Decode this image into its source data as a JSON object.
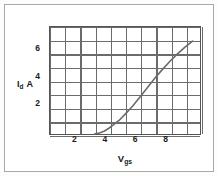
{
  "chart_data": {
    "type": "line",
    "title": "",
    "subtitle": "",
    "xlabel": "Vgs",
    "ylabel": "Id A",
    "xlabel_base": "V",
    "xlabel_sub": "gs",
    "ylabel_base": "I",
    "ylabel_sub": "d",
    "ylabel_unit": "A",
    "xlim": [
      0,
      10
    ],
    "ylim": [
      0,
      8
    ],
    "xticks": [
      2,
      4,
      6,
      8
    ],
    "yticks": [
      2,
      4,
      6
    ],
    "xtick_labels": [
      "2",
      "4",
      "6",
      "8"
    ],
    "ytick_labels": [
      "2",
      "4",
      "6"
    ],
    "x_gridlines": [
      0,
      1,
      2,
      3,
      4,
      5,
      6,
      7,
      8,
      9,
      10
    ],
    "y_gridlines": [
      0,
      1,
      2,
      3,
      4,
      5,
      6,
      7,
      8
    ],
    "grid": true,
    "legend": "none",
    "series": [
      {
        "name": "Id vs Vgs",
        "color": "#6b6b6b",
        "x": [
          3.0,
          3.3,
          3.6,
          3.9,
          4.2,
          4.6,
          5.0,
          5.5,
          6.0,
          6.5,
          7.0,
          7.5,
          8.0,
          8.5,
          9.0,
          9.5
        ],
        "y": [
          0.05,
          0.12,
          0.25,
          0.45,
          0.7,
          1.05,
          1.5,
          2.1,
          2.8,
          3.5,
          4.2,
          4.85,
          5.45,
          6.0,
          6.5,
          6.95
        ]
      }
    ],
    "annotations": []
  },
  "figure": {
    "frame_color": "#a8a8a8",
    "grid_color": "#6b6b6b",
    "axis_color": "#555555",
    "background": "#ffffff"
  }
}
